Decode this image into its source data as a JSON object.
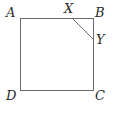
{
  "figure": {
    "shape": "square",
    "stroke_color": "#6b6b6b",
    "label_color": "#2b2b2b",
    "background_color": "#ffffff",
    "stroke_width": 1,
    "square": {
      "corners": {
        "A": {
          "x": 20,
          "y": 18
        },
        "B": {
          "x": 93,
          "y": 18
        },
        "C": {
          "x": 93,
          "y": 90
        },
        "D": {
          "x": 20,
          "y": 90
        }
      },
      "path": "M 20 18 L 93 18 L 93 90 L 20 90 Z"
    },
    "segment_XY": {
      "from": {
        "point": "X",
        "x": 72,
        "y": 18
      },
      "to": {
        "point": "Y",
        "x": 93,
        "y": 39
      },
      "path": "M 72 18 L 93 39"
    },
    "labels": [
      {
        "id": "A",
        "text": "A",
        "position": "top-left-outside"
      },
      {
        "id": "B",
        "text": "B",
        "position": "top-right-outside"
      },
      {
        "id": "C",
        "text": "C",
        "position": "bottom-right-outside"
      },
      {
        "id": "D",
        "text": "D",
        "position": "bottom-left-outside"
      },
      {
        "id": "X",
        "text": "X",
        "position": "above-top-edge"
      },
      {
        "id": "Y",
        "text": "Y",
        "position": "right-of-right-edge"
      }
    ]
  }
}
